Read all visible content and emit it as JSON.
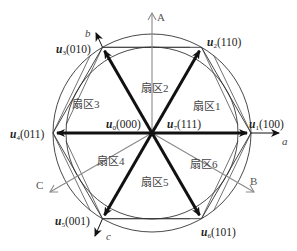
{
  "diagram": {
    "type": "space-vector-hexagon",
    "center": [
      152,
      133
    ],
    "colors": {
      "vector": "#111111",
      "phase_axis": "#8a8a8a",
      "hexagon": "#333333",
      "circle": "#333333"
    },
    "phase_axes": [
      {
        "label": "A",
        "angle_deg": 90
      },
      {
        "label": "B",
        "angle_deg": -30
      },
      {
        "label": "C",
        "angle_deg": 210
      }
    ],
    "vector_axes": [
      {
        "label": "a",
        "angle_deg": 0
      },
      {
        "label": "b",
        "angle_deg": 120
      },
      {
        "label": "c",
        "angle_deg": 240
      }
    ],
    "vectors": [
      {
        "name": "u",
        "sub": "1",
        "state": "(100)"
      },
      {
        "name": "u",
        "sub": "2",
        "state": "(110)"
      },
      {
        "name": "u",
        "sub": "3",
        "state": "(010)"
      },
      {
        "name": "u",
        "sub": "4",
        "state": "(011)"
      },
      {
        "name": "u",
        "sub": "5",
        "state": "(001)"
      },
      {
        "name": "u",
        "sub": "6",
        "state": "(101)"
      }
    ],
    "zero_vectors": [
      {
        "name": "u",
        "sub": "0",
        "state": "(000)"
      },
      {
        "name": "u",
        "sub": "7",
        "state": "(111)"
      }
    ],
    "sectors": [
      {
        "label": "扇区1"
      },
      {
        "label": "扇区2"
      },
      {
        "label": "扇区3"
      },
      {
        "label": "扇区4"
      },
      {
        "label": "扇区5"
      },
      {
        "label": "扇区6"
      }
    ]
  }
}
